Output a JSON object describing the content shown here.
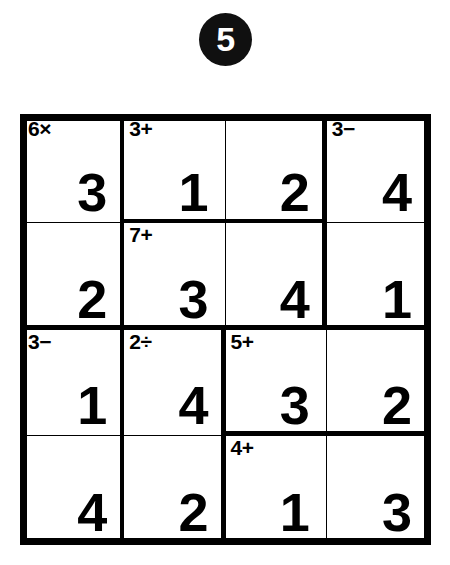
{
  "badge": {
    "number": "5",
    "color": "#101010",
    "text_color": "#ffffff"
  },
  "puzzle": {
    "type": "kenken",
    "size": 4,
    "grid_color": "#000000",
    "cell_background": "#ffffff",
    "rows": [
      [
        {
          "value": "3",
          "cage_label": "6×",
          "thick_right": true,
          "thick_bottom": false
        },
        {
          "value": "1",
          "cage_label": "3+",
          "thick_right": false,
          "thick_bottom": true
        },
        {
          "value": "2",
          "cage_label": "",
          "thick_right": true,
          "thick_bottom": true
        },
        {
          "value": "4",
          "cage_label": "3−",
          "thick_right": false,
          "thick_bottom": false
        }
      ],
      [
        {
          "value": "2",
          "cage_label": "",
          "thick_right": true,
          "thick_bottom": true
        },
        {
          "value": "3",
          "cage_label": "7+",
          "thick_right": false,
          "thick_bottom": true
        },
        {
          "value": "4",
          "cage_label": "",
          "thick_right": true,
          "thick_bottom": true
        },
        {
          "value": "1",
          "cage_label": "",
          "thick_right": false,
          "thick_bottom": true
        }
      ],
      [
        {
          "value": "1",
          "cage_label": "3−",
          "thick_right": true,
          "thick_bottom": false
        },
        {
          "value": "4",
          "cage_label": "2÷",
          "thick_right": true,
          "thick_bottom": false
        },
        {
          "value": "3",
          "cage_label": "5+",
          "thick_right": false,
          "thick_bottom": true
        },
        {
          "value": "2",
          "cage_label": "",
          "thick_right": false,
          "thick_bottom": true
        }
      ],
      [
        {
          "value": "4",
          "cage_label": "",
          "thick_right": true,
          "thick_bottom": false
        },
        {
          "value": "2",
          "cage_label": "",
          "thick_right": true,
          "thick_bottom": false
        },
        {
          "value": "1",
          "cage_label": "4+",
          "thick_right": false,
          "thick_bottom": false
        },
        {
          "value": "3",
          "cage_label": "",
          "thick_right": false,
          "thick_bottom": false
        }
      ]
    ],
    "cages": [
      {
        "label": "6×",
        "cells": [
          [
            0,
            0
          ],
          [
            1,
            0
          ]
        ]
      },
      {
        "label": "3+",
        "cells": [
          [
            0,
            1
          ],
          [
            0,
            2
          ]
        ]
      },
      {
        "label": "3−",
        "cells": [
          [
            0,
            3
          ],
          [
            1,
            3
          ]
        ]
      },
      {
        "label": "7+",
        "cells": [
          [
            1,
            1
          ],
          [
            1,
            2
          ]
        ]
      },
      {
        "label": "3−",
        "cells": [
          [
            2,
            0
          ],
          [
            3,
            0
          ]
        ]
      },
      {
        "label": "2÷",
        "cells": [
          [
            2,
            1
          ],
          [
            3,
            1
          ]
        ]
      },
      {
        "label": "5+",
        "cells": [
          [
            2,
            2
          ],
          [
            2,
            3
          ]
        ]
      },
      {
        "label": "4+",
        "cells": [
          [
            3,
            2
          ],
          [
            3,
            3
          ]
        ]
      }
    ]
  }
}
